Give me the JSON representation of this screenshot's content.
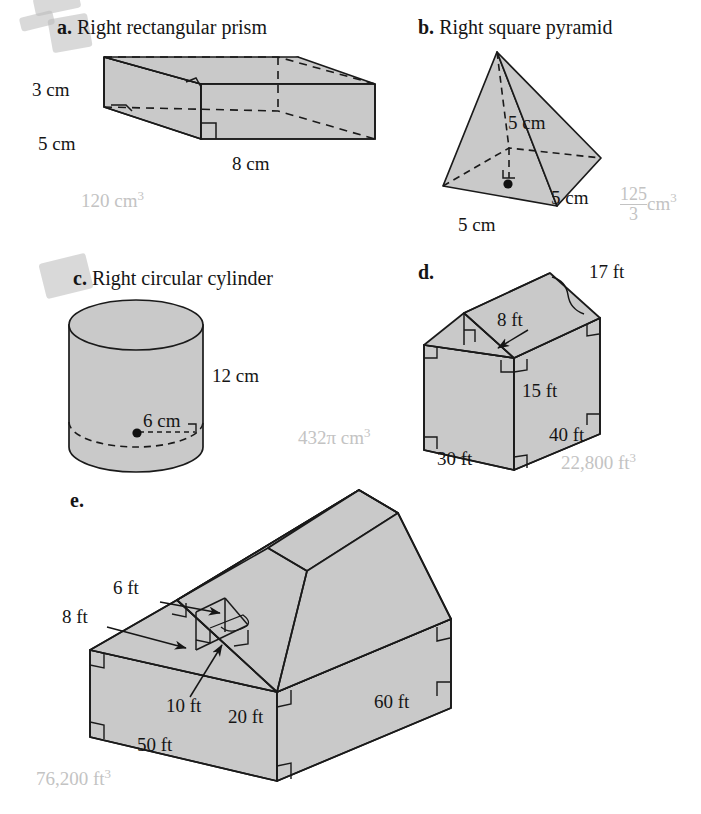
{
  "page": {
    "background": "#ffffff",
    "ink": "#151515",
    "answer_color": "#c3c3c3",
    "solid_fill": "#c9c9c9",
    "solid_stroke": "#1a1a1a"
  },
  "figures": [
    {
      "key": "a",
      "letter": "a.",
      "title": "Right rectangular prism",
      "shape": "right-rectangular-prism",
      "dimensions": [
        {
          "name": "height",
          "text": "3 cm"
        },
        {
          "name": "width",
          "text": "5 cm"
        },
        {
          "name": "length",
          "text": "8 cm"
        }
      ],
      "answer": "120 cm",
      "answer_exponent": "3"
    },
    {
      "key": "b",
      "letter": "b.",
      "title": "Right square pyramid",
      "shape": "right-square-pyramid",
      "dimensions": [
        {
          "name": "height",
          "text": "5 cm"
        },
        {
          "name": "base-edge-right",
          "text": "5 cm"
        },
        {
          "name": "base-edge-front",
          "text": "5 cm"
        }
      ],
      "answer_numerator": "125",
      "answer_denominator": "3",
      "answer_unit": "cm",
      "answer_exponent": "3"
    },
    {
      "key": "c",
      "letter": "c.",
      "title": "Right circular cylinder",
      "shape": "right-circular-cylinder",
      "dimensions": [
        {
          "name": "height",
          "text": "12 cm"
        },
        {
          "name": "radius",
          "text": "6 cm"
        }
      ],
      "answer": "432π cm",
      "answer_exponent": "3"
    },
    {
      "key": "d",
      "letter": "d.",
      "title": "",
      "shape": "house-prism",
      "dimensions": [
        {
          "name": "roof-slant",
          "text": "17 ft"
        },
        {
          "name": "roof-height",
          "text": "8 ft"
        },
        {
          "name": "wall-height",
          "text": "15 ft"
        },
        {
          "name": "depth",
          "text": "40 ft"
        },
        {
          "name": "width",
          "text": "30 ft"
        }
      ],
      "answer": "22,800 ft",
      "answer_exponent": "3"
    },
    {
      "key": "e",
      "letter": "e.",
      "title": "",
      "shape": "barn-prism",
      "dimensions": [
        {
          "name": "roof-peak-height",
          "text": "6 ft"
        },
        {
          "name": "roof-slant",
          "text": "8 ft"
        },
        {
          "name": "roof-half-width",
          "text": "10 ft"
        },
        {
          "name": "wall-height",
          "text": "20 ft"
        },
        {
          "name": "front-width",
          "text": "50 ft"
        },
        {
          "name": "depth",
          "text": "60 ft"
        }
      ],
      "answer": "76,200 ft",
      "answer_exponent": "3"
    }
  ]
}
